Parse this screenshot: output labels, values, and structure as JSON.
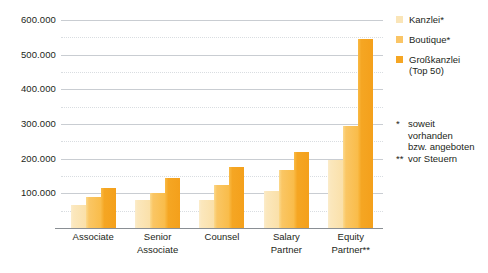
{
  "chart_data": {
    "type": "bar",
    "title": "",
    "subtitle": "",
    "xlabel": "",
    "ylabel": "",
    "ylim": [
      0,
      600000
    ],
    "ytick_labels": [
      "600.000",
      "500.000",
      "400.000",
      "300.000",
      "200.000",
      "100.000"
    ],
    "ytick_values": [
      600000,
      500000,
      400000,
      300000,
      200000,
      100000
    ],
    "minor_gridlines": [
      550000,
      450000,
      350000,
      250000,
      150000,
      50000
    ],
    "grid": true,
    "legend_position": "right",
    "categories": [
      "Associate",
      "Senior Associate",
      "Counsel",
      "Salary Partner",
      "Equity Partner**"
    ],
    "category_lines": [
      [
        "Associate",
        ""
      ],
      [
        "Senior",
        "Associate"
      ],
      [
        "Counsel",
        ""
      ],
      [
        "Salary",
        "Partner"
      ],
      [
        "Equity",
        "Partner**"
      ]
    ],
    "series": [
      {
        "name": "Kanzlei*",
        "color": "#fae5b8",
        "values": [
          65000,
          82000,
          82000,
          107000,
          197000
        ]
      },
      {
        "name": "Boutique*",
        "color": "#fac566",
        "values": [
          90000,
          100000,
          125000,
          167000,
          295000
        ]
      },
      {
        "name": "Großkanzlei (Top 50)",
        "color": "#f5a623",
        "values": [
          115000,
          145000,
          175000,
          218000,
          545000
        ]
      }
    ],
    "annotations": [
      {
        "mark": "*",
        "text": "soweit vorhanden bzw. angeboten"
      },
      {
        "mark": "**",
        "text": "vor Steuern"
      }
    ]
  },
  "legend": {
    "items": [
      {
        "label": "Kanzlei*",
        "sub": ""
      },
      {
        "label": "Boutique*",
        "sub": ""
      },
      {
        "label": "Großkanzlei",
        "sub": "(Top 50)"
      }
    ]
  },
  "footnotes": [
    {
      "mark": "*",
      "line1": "soweit",
      "line2": "vorhanden",
      "line3": "bzw. angeboten"
    },
    {
      "mark": "**",
      "line1": "vor Steuern",
      "line2": "",
      "line3": ""
    }
  ],
  "colors": {
    "series1": "#fae5b8",
    "series2": "#fac566",
    "series3": "#f5a623",
    "gridline": "#c9cdd2",
    "axis": "#8a8f94",
    "text": "#231f20",
    "background": "#ffffff"
  }
}
